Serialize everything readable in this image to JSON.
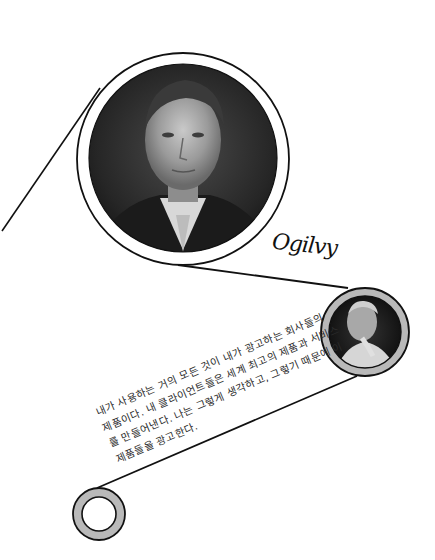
{
  "portrait_large": {
    "subject": "black-and-white portrait of a man in suit and tie",
    "frame": "white ring with black outline"
  },
  "portrait_small": {
    "subject": "black-and-white portrait of an older man, hand on chin",
    "frame": "gray ring with black outline"
  },
  "signature": {
    "text": "Ogilvy"
  },
  "quote": {
    "lines": [
      "내가 사용하는 거의 모든 것이 내가 광고하는 회사들의",
      "제품이다. 내 클라이언트들은 세계 최고의 제품과 서비스",
      "를 만들어낸다. 나는 그렇게 생각하고, 그렇기 때문에 이",
      "제품들을 광고한다."
    ]
  },
  "colors": {
    "background": "#ffffff",
    "line": "#111111",
    "ring_gray": "#b9b9b9",
    "text": "#2a2a2a"
  }
}
